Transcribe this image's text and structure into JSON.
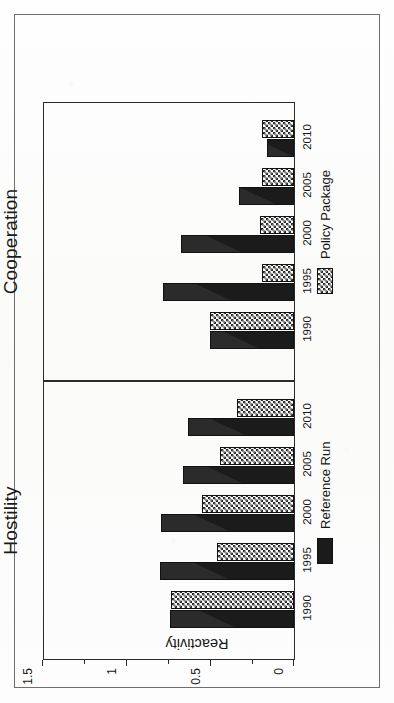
{
  "figure": {
    "y_axis_title": "Reactivity",
    "legend": {
      "reference_run": "Reference Run",
      "policy_package": "Policy Package",
      "reference_swatch": "solid-black-swatch",
      "policy_swatch": "checkered-swatch"
    },
    "panels": {
      "hostility_title": "Hostility",
      "cooperation_title": "Cooperation"
    }
  },
  "chart_data": {
    "type": "bar",
    "title": "",
    "xlabel": "",
    "ylabel": "Reactivity",
    "ylim": [
      0,
      1.5
    ],
    "yticks": [
      "0",
      "0.5",
      "1",
      "1.5"
    ],
    "ytick_values": [
      0,
      0.5,
      1,
      1.5
    ],
    "minor_ytick_values": [
      0.25,
      0.75,
      1.25
    ],
    "grid": false,
    "legend_position": "bottom",
    "orientation": "rotated-90-ccw",
    "categories": [
      "1990",
      "1995",
      "2000",
      "2005",
      "2010"
    ],
    "panels": [
      {
        "name": "Hostility",
        "series": [
          {
            "name": "Reference Run",
            "values": [
              0.74,
              0.8,
              0.79,
              0.66,
              0.63
            ]
          },
          {
            "name": "Policy Package",
            "values": [
              0.73,
              0.46,
              0.55,
              0.44,
              0.34
            ]
          }
        ]
      },
      {
        "name": "Cooperation",
        "series": [
          {
            "name": "Reference Run",
            "values": [
              0.5,
              0.78,
              0.67,
              0.33,
              0.16
            ]
          },
          {
            "name": "Policy Package",
            "values": [
              0.5,
              0.19,
              0.2,
              0.19,
              0.19
            ]
          }
        ]
      }
    ]
  }
}
